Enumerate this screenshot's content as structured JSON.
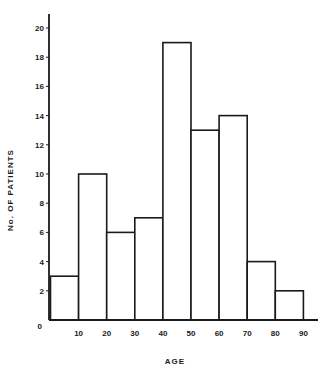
{
  "chart_data": {
    "type": "bar",
    "title": "",
    "xlabel": "AGE",
    "ylabel": "No. OF PATIENTS",
    "categories": [
      "0-10",
      "10-20",
      "20-30",
      "30-40",
      "40-50",
      "50-60",
      "60-70",
      "70-80",
      "80-90"
    ],
    "bin_edges": [
      0,
      10,
      20,
      30,
      40,
      50,
      60,
      70,
      80,
      90
    ],
    "values": [
      3,
      10,
      6,
      7,
      19,
      13,
      14,
      4,
      2
    ],
    "xticks": [
      "0",
      "10",
      "20",
      "30",
      "40",
      "50",
      "60",
      "70",
      "80",
      "90"
    ],
    "yticks": [
      "0",
      "2",
      "4",
      "6",
      "8",
      "10",
      "12",
      "14",
      "16",
      "18",
      "20"
    ],
    "xlim": [
      0,
      95
    ],
    "ylim": [
      0,
      21
    ],
    "grid": false,
    "legend": null,
    "bar_fill": "#ffffff",
    "bar_stroke": "#1a1a1a"
  }
}
